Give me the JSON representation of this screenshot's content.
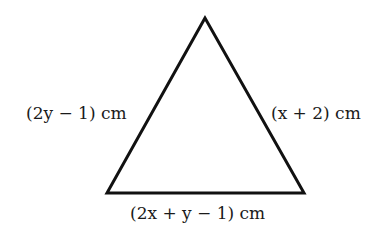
{
  "diagram": {
    "shape": "triangle",
    "vertices": {
      "apex": [
        205,
        18
      ],
      "bottom_left": [
        107,
        193
      ],
      "bottom_right": [
        304,
        193
      ]
    },
    "stroke_color": "#111111",
    "side_labels": {
      "left": "(2y − 1) cm",
      "right": "(x + 2) cm",
      "bottom": "(2x + y − 1) cm"
    }
  }
}
